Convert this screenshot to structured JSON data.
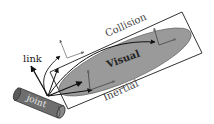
{
  "diagram": {
    "labels": {
      "link": "link",
      "joint": "joint",
      "visual": "Visual",
      "collision": "Collision",
      "inertial": "Inertial"
    },
    "colors": {
      "visual_fill": "#9a9a9a",
      "joint_fill": "#6e6e6e",
      "joint_cap": "#8a8a8a",
      "outline": "#333333",
      "arrow": "#111111",
      "frame_gray": "#777777",
      "text": "#222222",
      "joint_text": "#e6e6e6"
    }
  }
}
